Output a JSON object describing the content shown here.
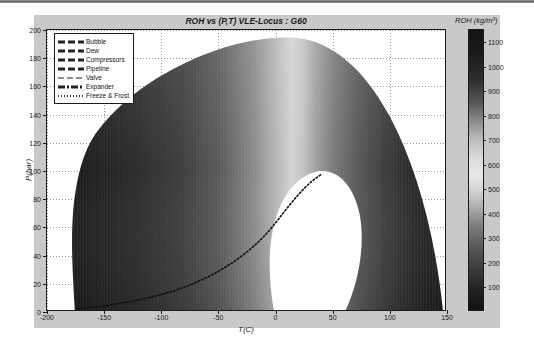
{
  "chart_data": {
    "type": "heatmap",
    "title": "ROH vs (P,T) VLE-Locus : G60",
    "xlabel": "T(C)",
    "ylabel": "P(bar)",
    "xlim": [
      -200,
      150
    ],
    "ylim": [
      0,
      200
    ],
    "xticks": [
      -200,
      -150,
      -100,
      -50,
      0,
      50,
      100,
      150
    ],
    "xticklabels": [
      "-200",
      "-150",
      "-100",
      "-50",
      "0",
      "50",
      "100",
      "150"
    ],
    "yticks": [
      0,
      20,
      40,
      60,
      80,
      100,
      120,
      140,
      160,
      180,
      200
    ],
    "yticklabels": [
      "0",
      "20",
      "40",
      "60",
      "80",
      "100",
      "120",
      "140",
      "160",
      "180",
      "200"
    ],
    "grid": true,
    "colorbar": {
      "label": "ROH (kg/m³)",
      "position": "right",
      "vmin": 0,
      "vmax": 1150,
      "ticks": [
        100,
        200,
        300,
        400,
        500,
        600,
        700,
        800,
        900,
        1000,
        1100
      ],
      "ticklabels": [
        "100",
        "200",
        "300",
        "400",
        "500",
        "600",
        "700",
        "800",
        "900",
        "1000",
        "1100"
      ],
      "colormap": "gray-reversed",
      "note": "dark = high density, light = low density"
    },
    "legend": {
      "position": "upper-left",
      "entries": [
        {
          "label": "Bubble",
          "style": "dashed-thick"
        },
        {
          "label": "Dew",
          "style": "dashed-thick"
        },
        {
          "label": "Compressors",
          "style": "dashed-thick"
        },
        {
          "label": "Pipeline",
          "style": "dashed-thick"
        },
        {
          "label": "Valve",
          "style": "dashed-light"
        },
        {
          "label": "Expander",
          "style": "dash-dot"
        },
        {
          "label": "Freeze & Frost",
          "style": "dotted"
        }
      ]
    },
    "boundary_notes": {
      "dome_peak_pressure": 200,
      "dome_peak_temperature": -25,
      "left_edge_temperature": -175,
      "right_edge_temperature": 150,
      "vapour_cutout_temperature_range": [
        -5,
        45
      ],
      "vapour_cutout_pressure_range": [
        0,
        90
      ]
    }
  },
  "figure": {
    "title": "ROH vs (P,T) VLE-Locus : G60",
    "colorbar_title": "ROH (kg/m³)"
  }
}
